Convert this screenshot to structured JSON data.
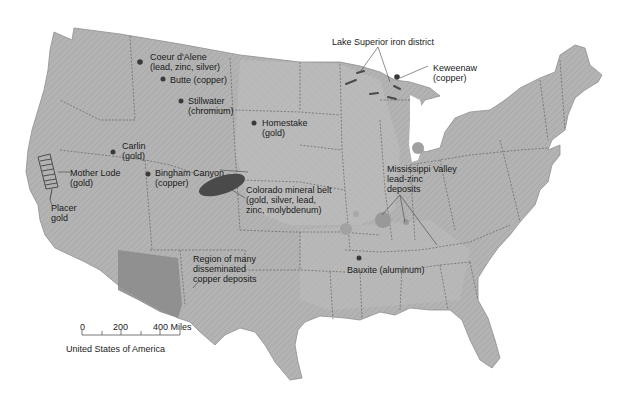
{
  "map": {
    "title": "United States of America",
    "background": "#ffffff",
    "land_color": "#b5b5b5",
    "deposit_color": "#4a4a4a",
    "region_color": "#8c8c8c",
    "labels": {
      "coeur_dalene": "Coeur d'Alene\n(lead, zinc, silver)",
      "butte": "Butte (copper)",
      "stillwater": "Stillwater\n(chromium)",
      "homestake": "Homestake\n(gold)",
      "carlin": "Carlin\n(gold)",
      "bingham": "Bingham Canyon\n(copper)",
      "mother_lode": "Mother Lode\n(gold)",
      "placer": "Placer\ngold",
      "colorado": "Colorado mineral belt\n(gold, silver, lead,\nzinc, molybdenum)",
      "lake_superior": "Lake Superior iron district",
      "keweenaw": "Keweenaw\n(copper)",
      "mississippi": "Mississippi Valley\nlead-zinc\ndeposits",
      "bauxite": "Bauxite (aluminum)",
      "copper_region": "Region of many\ndisseminated\ncopper deposits"
    },
    "scale_bar": {
      "ticks": [
        "0",
        "200",
        "400 Miles"
      ],
      "caption": "United States of America"
    }
  }
}
